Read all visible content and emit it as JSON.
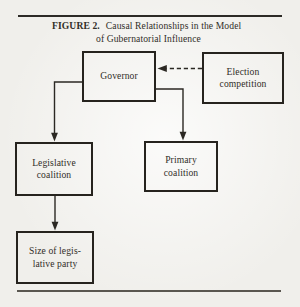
{
  "figure": {
    "label": "FIGURE 2.",
    "title_line1": "Causal Relationships in the Model",
    "title_line2": "of Gubernatorial Influence"
  },
  "nodes": {
    "governor": {
      "line1": "Governor"
    },
    "election_competition": {
      "line1": "Election",
      "line2": "competition"
    },
    "legislative_coalition": {
      "line1": "Legislative",
      "line2": "coalition"
    },
    "primary_coalition": {
      "line1": "Primary",
      "line2": "coalition"
    },
    "size_of_legislative_party": {
      "line1": "Size of legis-",
      "line2": "lative party"
    }
  },
  "edges": [
    {
      "from": "election_competition",
      "to": "governor",
      "style": "dashed",
      "direction": "left"
    },
    {
      "from": "governor",
      "to": "legislative_coalition",
      "style": "solid",
      "direction": "down"
    },
    {
      "from": "governor",
      "to": "primary_coalition",
      "style": "solid",
      "direction": "down"
    },
    {
      "from": "legislative_coalition",
      "to": "size_of_legislative_party",
      "style": "solid",
      "direction": "down"
    }
  ],
  "colors": {
    "background": "#f0efeb",
    "line": "#2b2823",
    "text": "#312e28",
    "top_rule": "#2c2a26",
    "bottom_rule": "#5a5750"
  }
}
